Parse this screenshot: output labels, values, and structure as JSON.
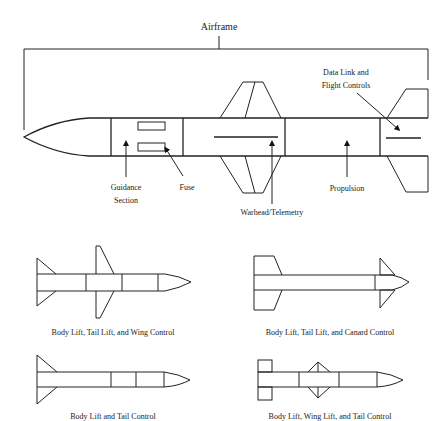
{
  "figure": {
    "colors": {
      "line": "#222222",
      "background": "#ffffff",
      "arrow": "#111111"
    },
    "main_diagram": {
      "title_label": "Airframe",
      "labels": {
        "guidance_line1": "Guidance",
        "guidance_line2": "Section",
        "fuse": "Fuse",
        "warhead": "Warhead/Telemetry",
        "propulsion": "Propulsion",
        "datalink_line1": "Data Link and",
        "datalink_line2": "Flight Controls"
      }
    },
    "configurations": [
      {
        "id": "wing-control",
        "caption": "Body Lift, Tail Lift, and Wing Control"
      },
      {
        "id": "canard-control",
        "caption": "Body Lift, Tail Lift, and Canard Control"
      },
      {
        "id": "tail-control",
        "caption": "Body Lift and Tail Control"
      },
      {
        "id": "wing-lift-tail-control",
        "caption": "Body Lift, Wing Lift, and Tail Control"
      }
    ]
  }
}
